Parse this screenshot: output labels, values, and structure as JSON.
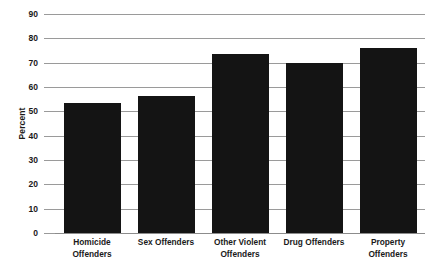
{
  "chart_data": {
    "type": "bar",
    "title": "",
    "xlabel": "",
    "ylabel": "Percent",
    "ylim": [
      0,
      90
    ],
    "ytick_step": 10,
    "grid": true,
    "legend": "none",
    "bar_color": "#141414",
    "gridline_color": "#9a9a9a",
    "categories": [
      "Homicide Offenders",
      "Sex Offenders",
      "Other Violent Offenders",
      "Drug Offenders",
      "Property Offenders"
    ],
    "category_lines": [
      [
        "Homicide",
        "Offenders"
      ],
      [
        "Sex Offenders",
        ""
      ],
      [
        "Other Violent",
        "Offenders"
      ],
      [
        "Drug Offenders",
        ""
      ],
      [
        "Property",
        "Offenders"
      ]
    ],
    "values": [
      53.5,
      56.5,
      73.5,
      70.0,
      76.0
    ],
    "ytick_labels": [
      "90",
      "80",
      "70",
      "60",
      "50",
      "40",
      "30",
      "20",
      "10",
      "0"
    ],
    "ytick_values": [
      90,
      80,
      70,
      60,
      50,
      40,
      30,
      20,
      10,
      0
    ]
  }
}
